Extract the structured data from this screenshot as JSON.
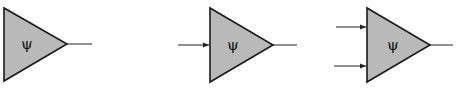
{
  "diagram": {
    "title": "",
    "fill_color": "#b9b9b9",
    "stroke_color": "#1a1a1a",
    "nodes": [
      {
        "id": "neuron-0-inputs",
        "label": "ψ",
        "inputs": 0,
        "outputs": 1
      },
      {
        "id": "neuron-1-input",
        "label": "ψ",
        "inputs": 1,
        "outputs": 1
      },
      {
        "id": "neuron-2-inputs",
        "label": "ψ",
        "inputs": 2,
        "outputs": 1
      }
    ]
  }
}
